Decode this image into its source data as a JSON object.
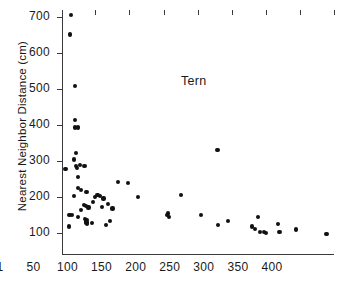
{
  "chart_data": {
    "type": "scatter",
    "title": "",
    "annotation": "Tern",
    "xlabel": "",
    "ylabel": "Nearest Neighbor Distance (cm)",
    "xlim": [
      1,
      400
    ],
    "ylim": [
      40,
      720
    ],
    "grid": false,
    "legend": "none",
    "xticks": [
      1,
      50,
      100,
      150,
      200,
      250,
      300,
      350,
      400
    ],
    "xtick_labels": [
      "1",
      "50",
      "100",
      "150",
      "200",
      "250",
      "300",
      "350",
      "400"
    ],
    "yticks": [
      100,
      200,
      300,
      400,
      500,
      600,
      700
    ],
    "ytick_labels": [
      "100",
      "200",
      "300",
      "400",
      "500",
      "600",
      "700"
    ],
    "marker": "filled-circle",
    "marker_color": "#111111",
    "axis_color": "#3a3a3a",
    "background_color": "#ffffff",
    "n_points": 62,
    "points": [
      [
        14,
        707
      ],
      [
        13,
        652
      ],
      [
        20,
        508
      ],
      [
        20,
        415
      ],
      [
        20,
        394
      ],
      [
        25,
        394
      ],
      [
        21,
        322
      ],
      [
        19,
        305
      ],
      [
        22,
        288
      ],
      [
        23,
        281
      ],
      [
        28,
        289
      ],
      [
        34,
        288
      ],
      [
        6,
        278
      ],
      [
        25,
        257
      ],
      [
        29,
        220
      ],
      [
        24,
        227
      ],
      [
        37,
        215
      ],
      [
        19,
        203
      ],
      [
        49,
        200
      ],
      [
        53,
        207
      ],
      [
        46,
        186
      ],
      [
        57,
        203
      ],
      [
        62,
        197
      ],
      [
        83,
        242
      ],
      [
        98,
        240
      ],
      [
        112,
        201
      ],
      [
        68,
        182
      ],
      [
        75,
        169
      ],
      [
        60,
        174
      ],
      [
        36,
        177
      ],
      [
        33,
        178
      ],
      [
        40,
        172
      ],
      [
        29,
        165
      ],
      [
        12,
        150
      ],
      [
        16,
        152
      ],
      [
        25,
        145
      ],
      [
        35,
        140
      ],
      [
        36,
        133
      ],
      [
        37,
        137
      ],
      [
        37,
        130
      ],
      [
        38,
        127
      ],
      [
        45,
        129
      ],
      [
        66,
        123
      ],
      [
        71,
        134
      ],
      [
        11,
        119
      ],
      [
        155,
        150
      ],
      [
        158,
        145
      ],
      [
        157,
        155
      ],
      [
        176,
        207
      ],
      [
        205,
        151
      ],
      [
        229,
        332
      ],
      [
        230,
        124
      ],
      [
        244,
        135
      ],
      [
        280,
        119
      ],
      [
        284,
        113
      ],
      [
        288,
        145
      ],
      [
        292,
        104
      ],
      [
        297,
        103
      ],
      [
        300,
        102
      ],
      [
        318,
        127
      ],
      [
        320,
        104
      ],
      [
        344,
        111
      ],
      [
        389,
        99
      ]
    ]
  }
}
